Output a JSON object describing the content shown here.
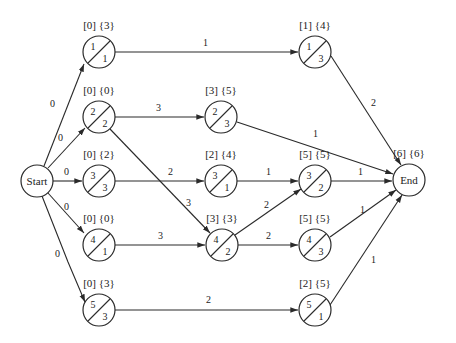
{
  "diagram": {
    "type": "activity-on-node network",
    "colors": {
      "line": "#2a2a2a",
      "text": "#222222",
      "background": "#ffffff"
    },
    "terminal_nodes": {
      "start": {
        "label": "Start"
      },
      "end": {
        "label": "End",
        "times": "[6] {6}"
      }
    },
    "nodes": [
      {
        "id": "a",
        "top": "1",
        "bottom": "1",
        "times": "[0] {3}"
      },
      {
        "id": "b",
        "top": "2",
        "bottom": "2",
        "times": "[0] {0}"
      },
      {
        "id": "c",
        "top": "3",
        "bottom": "3",
        "times": "[0] {2}"
      },
      {
        "id": "d",
        "top": "4",
        "bottom": "1",
        "times": "[0] {0}"
      },
      {
        "id": "e",
        "top": "5",
        "bottom": "3",
        "times": "[0] {3}"
      },
      {
        "id": "f",
        "top": "2",
        "bottom": "3",
        "times": "[3] {5}"
      },
      {
        "id": "g",
        "top": "3",
        "bottom": "1",
        "times": "[2] {4}"
      },
      {
        "id": "h",
        "top": "4",
        "bottom": "2",
        "times": "[3] {3}"
      },
      {
        "id": "i",
        "top": "1",
        "bottom": "3",
        "times": "[1] {4}"
      },
      {
        "id": "j",
        "top": "3",
        "bottom": "2",
        "times": "[5] {5}"
      },
      {
        "id": "k",
        "top": "4",
        "bottom": "3",
        "times": "[5] {5}"
      },
      {
        "id": "l",
        "top": "5",
        "bottom": "1",
        "times": "[2] {5}"
      }
    ],
    "edges": [
      {
        "from": "start",
        "to": "a",
        "weight": "0"
      },
      {
        "from": "start",
        "to": "b",
        "weight": "0"
      },
      {
        "from": "start",
        "to": "c",
        "weight": "0"
      },
      {
        "from": "start",
        "to": "d",
        "weight": "0"
      },
      {
        "from": "start",
        "to": "e",
        "weight": "0"
      },
      {
        "from": "a",
        "to": "i",
        "weight": "1"
      },
      {
        "from": "b",
        "to": "f",
        "weight": "3"
      },
      {
        "from": "b",
        "to": "h",
        "weight": "3"
      },
      {
        "from": "c",
        "to": "g",
        "weight": "2"
      },
      {
        "from": "d",
        "to": "h",
        "weight": "3"
      },
      {
        "from": "e",
        "to": "l",
        "weight": "2"
      },
      {
        "from": "f",
        "to": "end",
        "weight": "1"
      },
      {
        "from": "g",
        "to": "j",
        "weight": "1"
      },
      {
        "from": "h",
        "to": "j",
        "weight": "2"
      },
      {
        "from": "h",
        "to": "k",
        "weight": "2"
      },
      {
        "from": "i",
        "to": "end",
        "weight": "2"
      },
      {
        "from": "j",
        "to": "end",
        "weight": "1"
      },
      {
        "from": "k",
        "to": "end",
        "weight": "1"
      },
      {
        "from": "l",
        "to": "end",
        "weight": "1"
      }
    ]
  }
}
